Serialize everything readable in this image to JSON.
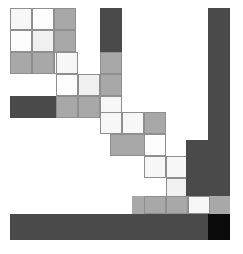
{
  "figure": {
    "width": 243,
    "height": 254,
    "background": "#ffffff",
    "grid": {
      "origin_x": 10,
      "origin_y": 8,
      "cell_size": 22,
      "columns": 11,
      "rows": 11,
      "border_color": "#8f8f8f",
      "grid_visible_on": "light-cells-only"
    }
  },
  "palette": {
    "white": "#fdfdfd",
    "near_white": "#f7f7f7",
    "very_light_gray": "#f0f0f0",
    "light_gray": "#e8e8e8",
    "mid_light_gray": "#c9c9c9",
    "mid_gray": "#a8a8a8",
    "dark_gray": "#4a4a4a",
    "black": "#0a0a0a"
  },
  "blocks": [
    {
      "name": "top-left-cell-r0c0",
      "x": 10,
      "y": 8,
      "w": 22,
      "h": 22,
      "fill": "#f7f7f7",
      "border": true
    },
    {
      "name": "top-left-cell-r0c1",
      "x": 32,
      "y": 8,
      "w": 22,
      "h": 22,
      "fill": "#fdfdfd",
      "border": true
    },
    {
      "name": "top-left-cell-r0c2",
      "x": 54,
      "y": 8,
      "w": 22,
      "h": 22,
      "fill": "#a8a8a8",
      "border": true
    },
    {
      "name": "top-left-cell-r1c0",
      "x": 10,
      "y": 30,
      "w": 22,
      "h": 22,
      "fill": "#fdfdfd",
      "border": true
    },
    {
      "name": "top-left-cell-r1c1",
      "x": 32,
      "y": 30,
      "w": 22,
      "h": 22,
      "fill": "#f0f0f0",
      "border": true
    },
    {
      "name": "top-left-cell-r1c2",
      "x": 54,
      "y": 30,
      "w": 22,
      "h": 22,
      "fill": "#a8a8a8",
      "border": true
    },
    {
      "name": "top-left-cell-r2c0",
      "x": 10,
      "y": 52,
      "w": 22,
      "h": 22,
      "fill": "#a8a8a8",
      "border": true
    },
    {
      "name": "top-left-cell-r2c1",
      "x": 32,
      "y": 52,
      "w": 22,
      "h": 22,
      "fill": "#a8a8a8",
      "border": true
    },
    {
      "name": "top-left-cell-r2c2",
      "x": 54,
      "y": 52,
      "w": 22,
      "h": 22,
      "fill": "#f0f0f0",
      "border": true
    },
    {
      "name": "step-cell-r3c3",
      "x": 54,
      "y": 52,
      "w": 22,
      "h": 22,
      "fill": "#f0f0f0",
      "border": true
    },
    {
      "name": "step-cell-r3c3b",
      "x": 54,
      "y": 52,
      "w": 22,
      "h": 22,
      "fill": "#f0f0f0",
      "border": true
    },
    {
      "name": "tall-bar-upper",
      "x": 100,
      "y": 8,
      "w": 22,
      "h": 100,
      "fill": "#4a4a4a",
      "border": false
    },
    {
      "name": "step-cell-a1",
      "x": 54,
      "y": 52,
      "w": 22,
      "h": 22,
      "fill": "#f7f7f7",
      "border": true
    },
    {
      "name": "step-cell-a2",
      "x": 54,
      "y": 52,
      "w": 22,
      "h": 22,
      "fill": "#f7f7f7",
      "border": true
    },
    {
      "name": "step-cell-b1",
      "x": 56,
      "y": 52,
      "w": 22,
      "h": 22,
      "fill": "#f7f7f7",
      "border": true
    },
    {
      "name": "step-cell-b2",
      "x": 56,
      "y": 74,
      "w": 22,
      "h": 22,
      "fill": "#fdfdfd",
      "border": true
    },
    {
      "name": "step-cell-b3",
      "x": 78,
      "y": 74,
      "w": 22,
      "h": 22,
      "fill": "#f0f0f0",
      "border": true
    },
    {
      "name": "step-cell-b4",
      "x": 78,
      "y": 96,
      "w": 22,
      "h": 22,
      "fill": "#c9c9c9",
      "border": true
    },
    {
      "name": "step-cell-b5",
      "x": 56,
      "y": 96,
      "w": 22,
      "h": 22,
      "fill": "#a8a8a8",
      "border": true
    },
    {
      "name": "upper-right-stub",
      "x": 100,
      "y": 52,
      "w": 22,
      "h": 22,
      "fill": "#a8a8a8",
      "border": true
    },
    {
      "name": "upper-right-stub2",
      "x": 100,
      "y": 74,
      "w": 22,
      "h": 22,
      "fill": "#a8a8a8",
      "border": true
    },
    {
      "name": "highlight-cell-1",
      "x": 100,
      "y": 96,
      "w": 22,
      "h": 22,
      "fill": "#fdfdfd",
      "border": true
    },
    {
      "name": "shelf-bar-upper",
      "x": 10,
      "y": 96,
      "w": 112,
      "h": 22,
      "fill": "#4a4a4a",
      "border": false
    },
    {
      "name": "shelf-row-upper-a",
      "x": 56,
      "y": 96,
      "w": 22,
      "h": 22,
      "fill": "#a8a8a8",
      "border": true
    },
    {
      "name": "shelf-row-upper-b",
      "x": 78,
      "y": 96,
      "w": 22,
      "h": 22,
      "fill": "#a8a8a8",
      "border": true
    },
    {
      "name": "shelf-row-upper-c",
      "x": 100,
      "y": 96,
      "w": 22,
      "h": 22,
      "fill": "#f7f7f7",
      "border": true
    },
    {
      "name": "mid-step-c1",
      "x": 100,
      "y": 112,
      "w": 22,
      "h": 22,
      "fill": "#f7f7f7",
      "border": true
    },
    {
      "name": "mid-step-c2",
      "x": 122,
      "y": 112,
      "w": 22,
      "h": 22,
      "fill": "#f7f7f7",
      "border": true
    },
    {
      "name": "mid-step-c3",
      "x": 122,
      "y": 134,
      "w": 22,
      "h": 22,
      "fill": "#f0f0f0",
      "border": true
    },
    {
      "name": "mid-step-c4",
      "x": 144,
      "y": 112,
      "w": 22,
      "h": 22,
      "fill": "#a8a8a8",
      "border": true
    },
    {
      "name": "mid-step-c5",
      "x": 144,
      "y": 134,
      "w": 22,
      "h": 22,
      "fill": "#a8a8a8",
      "border": true
    },
    {
      "name": "mid-shelf-bar",
      "x": 110,
      "y": 134,
      "w": 56,
      "h": 22,
      "fill": "#a8a8a8",
      "border": true
    },
    {
      "name": "mid-highlight",
      "x": 144,
      "y": 134,
      "w": 22,
      "h": 22,
      "fill": "#fdfdfd",
      "border": true
    },
    {
      "name": "low-step-d1",
      "x": 144,
      "y": 156,
      "w": 22,
      "h": 22,
      "fill": "#f7f7f7",
      "border": true
    },
    {
      "name": "low-step-d2",
      "x": 166,
      "y": 156,
      "w": 22,
      "h": 22,
      "fill": "#f7f7f7",
      "border": true
    },
    {
      "name": "low-step-d3",
      "x": 166,
      "y": 178,
      "w": 22,
      "h": 22,
      "fill": "#f0f0f0",
      "border": true
    },
    {
      "name": "low-step-d4",
      "x": 188,
      "y": 156,
      "w": 22,
      "h": 22,
      "fill": "#a8a8a8",
      "border": true
    },
    {
      "name": "low-step-d5",
      "x": 188,
      "y": 178,
      "w": 22,
      "h": 22,
      "fill": "#a8a8a8",
      "border": true
    },
    {
      "name": "right-bar-upper",
      "x": 208,
      "y": 8,
      "w": 22,
      "h": 132,
      "fill": "#4a4a4a",
      "border": false
    },
    {
      "name": "right-bar-wide",
      "x": 186,
      "y": 140,
      "w": 44,
      "h": 74,
      "fill": "#4a4a4a",
      "border": false
    },
    {
      "name": "low-shelf-bar",
      "x": 132,
      "y": 196,
      "w": 98,
      "h": 18,
      "fill": "#a8a8a8",
      "border": false
    },
    {
      "name": "low-shelf-cell-a",
      "x": 144,
      "y": 196,
      "w": 22,
      "h": 18,
      "fill": "#a8a8a8",
      "border": true
    },
    {
      "name": "low-shelf-cell-b",
      "x": 166,
      "y": 196,
      "w": 22,
      "h": 18,
      "fill": "#a8a8a8",
      "border": true
    },
    {
      "name": "low-shelf-cell-c",
      "x": 188,
      "y": 196,
      "w": 22,
      "h": 18,
      "fill": "#f7f7f7",
      "border": true
    },
    {
      "name": "bottom-bar-main",
      "x": 10,
      "y": 214,
      "w": 220,
      "h": 26,
      "fill": "#4a4a4a",
      "border": false
    },
    {
      "name": "bottom-right-black",
      "x": 208,
      "y": 214,
      "w": 22,
      "h": 26,
      "fill": "#0a0a0a",
      "border": false
    }
  ],
  "regions": [
    {
      "name": "top-left-block",
      "label": "3x3 cell cluster",
      "fill_variants": [
        "#f7f7f7",
        "#fdfdfd",
        "#a8a8a8",
        "#f0f0f0"
      ]
    },
    {
      "name": "descending-staircase",
      "label": "diagonal step sequence",
      "steps": 5
    },
    {
      "name": "vertical-bars",
      "label": "dark vertical columns",
      "count": 2
    },
    {
      "name": "horizontal-shelves",
      "label": "dark horizontal bars",
      "count": 3
    }
  ]
}
